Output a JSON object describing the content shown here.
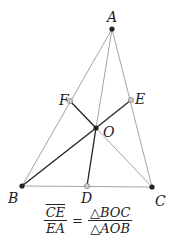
{
  "diagram": {
    "points": {
      "A": {
        "label": "A",
        "x": 112,
        "y": 29,
        "style": "dark"
      },
      "B": {
        "label": "B",
        "x": 22,
        "y": 186,
        "style": "dark"
      },
      "C": {
        "label": "C",
        "x": 152,
        "y": 187,
        "style": "dark"
      },
      "D": {
        "label": "D",
        "x": 87,
        "y": 186,
        "style": "light"
      },
      "E": {
        "label": "E",
        "x": 131,
        "y": 100,
        "style": "light"
      },
      "F": {
        "label": "F",
        "x": 70,
        "y": 101,
        "style": "light"
      },
      "O": {
        "label": "O",
        "x": 96,
        "y": 128,
        "style": "dark"
      }
    },
    "colors": {
      "thin_line": "#999999",
      "thick_line": "#222222",
      "dark_point": "#222222",
      "light_point": "#aaaaaa"
    }
  },
  "formula": {
    "left_num": "CE",
    "left_den": "EA",
    "equals": "=",
    "right_num": "△BOC",
    "right_den": "△AOB"
  }
}
